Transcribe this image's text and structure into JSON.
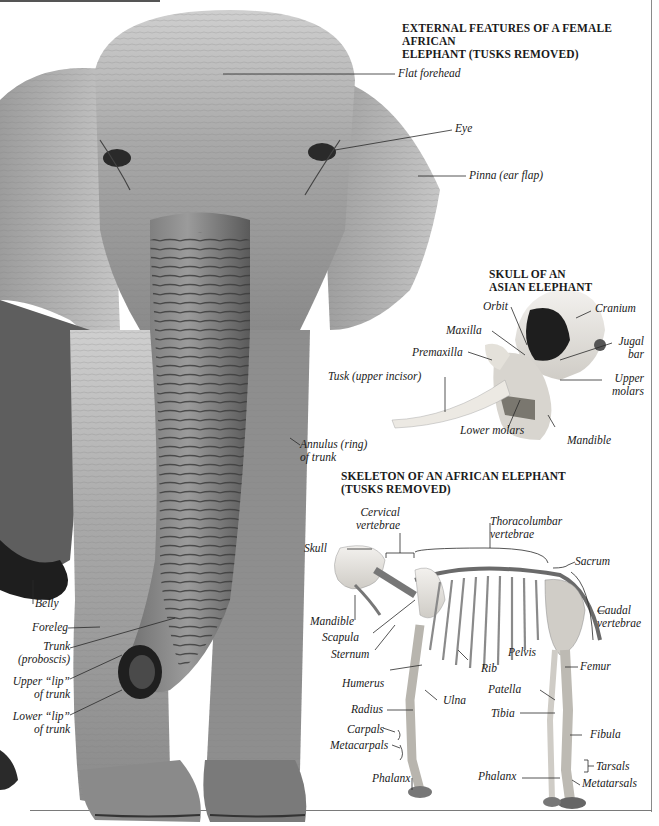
{
  "sections": {
    "external": {
      "title_line1": "EXTERNAL FEATURES OF A FEMALE AFRICAN",
      "title_line2": "ELEPHANT (TUSKS REMOVED)",
      "labels": {
        "flat_forehead": "Flat forehead",
        "eye": "Eye",
        "pinna": "Pinna (ear flap)",
        "annulus_1": "Annulus (ring)",
        "annulus_2": "of trunk",
        "belly": "Belly",
        "foreleg": "Foreleg",
        "trunk_1": "Trunk",
        "trunk_2": "(proboscis)",
        "upper_lip_1": "Upper “lip”",
        "upper_lip_2": "of trunk",
        "lower_lip_1": "Lower “lip”",
        "lower_lip_2": "of trunk"
      }
    },
    "skull": {
      "title_line1": "SKULL OF AN",
      "title_line2": "ASIAN ELEPHANT",
      "labels": {
        "orbit": "Orbit",
        "cranium": "Cranium",
        "maxilla": "Maxilla",
        "jugal_1": "Jugal",
        "jugal_2": "bar",
        "premaxilla": "Premaxilla",
        "tusk": "Tusk (upper incisor)",
        "upper_molars_1": "Upper",
        "upper_molars_2": "molars",
        "lower_molars": "Lower molars",
        "mandible": "Mandible"
      }
    },
    "skeleton": {
      "title_line1": "SKELETON OF AN AFRICAN ELEPHANT",
      "title_line2": "(TUSKS REMOVED)",
      "labels": {
        "cervical_1": "Cervical",
        "cervical_2": "vertebrae",
        "thoracolumbar_1": "Thoracolumbar",
        "thoracolumbar_2": "vertebrae",
        "skull": "Skull",
        "sacrum": "Sacrum",
        "caudal_1": "Caudal",
        "caudal_2": "vertebrae",
        "mandible": "Mandible",
        "scapula": "Scapula",
        "sternum": "Sternum",
        "pelvis": "Pelvis",
        "rib": "Rib",
        "femur": "Femur",
        "humerus": "Humerus",
        "patella": "Patella",
        "ulna": "Ulna",
        "radius": "Radius",
        "tibia": "Tibia",
        "carpals": "Carpals",
        "metacarpals": "Metacarpals",
        "fibula": "Fibula",
        "tarsals": "Tarsals",
        "phalanx_front": "Phalanx",
        "phalanx_hind": "Phalanx",
        "metatarsals": "Metatarsals"
      }
    }
  },
  "images": {
    "elephant_photo": "female-african-elephant-front-view",
    "skull_photo": "asian-elephant-skull",
    "skeleton_photo": "african-elephant-skeleton"
  }
}
